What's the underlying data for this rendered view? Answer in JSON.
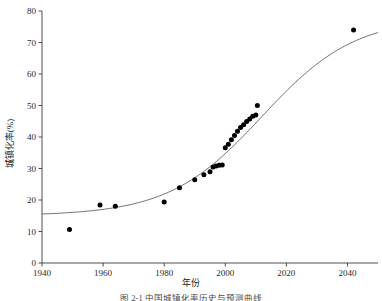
{
  "figure": {
    "xlabel": "年份",
    "ylabel": "城镇化率(%)",
    "caption": "图 2-1  中国城镇化率历史与预测曲线"
  },
  "chart_data": {
    "type": "scatter",
    "title": "",
    "xlabel": "年份",
    "ylabel": "城镇化率(%)",
    "xlim": [
      1940,
      2050
    ],
    "ylim": [
      0,
      80
    ],
    "xticks": [
      1940,
      1960,
      1980,
      2000,
      2020,
      2040
    ],
    "yticks": [
      0,
      10,
      20,
      30,
      40,
      50,
      60,
      70,
      80
    ],
    "grid": false,
    "legend": null,
    "marker_color": "#000000",
    "curve_color": "#4a4a4a",
    "series": [
      {
        "name": "观测值",
        "type": "scatter",
        "points": [
          [
            1949,
            10.6
          ],
          [
            1959,
            18.4
          ],
          [
            1964,
            18.0
          ],
          [
            1980,
            19.4
          ],
          [
            1985,
            23.9
          ],
          [
            1990,
            26.4
          ],
          [
            1993,
            28.0
          ],
          [
            1995,
            29.0
          ],
          [
            1996,
            30.5
          ],
          [
            1997,
            30.8
          ],
          [
            1998,
            31.0
          ],
          [
            1999,
            31.1
          ],
          [
            2000,
            36.6
          ],
          [
            2001,
            37.7
          ],
          [
            2002,
            39.1
          ],
          [
            2003,
            40.5
          ],
          [
            2004,
            41.8
          ],
          [
            2005,
            43.0
          ],
          [
            2006,
            43.9
          ],
          [
            2007,
            44.9
          ],
          [
            2008,
            45.7
          ],
          [
            2009,
            46.6
          ],
          [
            2010,
            47.0
          ],
          [
            2010.5,
            50.0
          ],
          [
            2042,
            74.0
          ]
        ]
      },
      {
        "name": "拟合曲线",
        "type": "line",
        "model": "logistic",
        "params": {
          "L": 78.0,
          "k": 0.0655,
          "x0": 2012.0,
          "floor": 15.0
        }
      }
    ]
  }
}
